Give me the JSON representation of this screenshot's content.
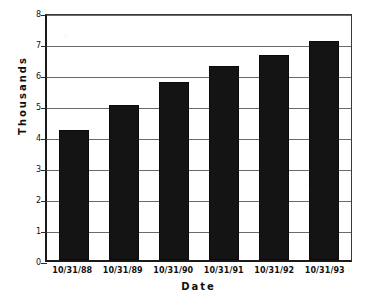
{
  "chart_data": {
    "type": "bar",
    "title": "",
    "xlabel": "Date",
    "ylabel": "Thousands",
    "categories": [
      "10/31/88",
      "10/31/89",
      "10/31/90",
      "10/31/91",
      "10/31/92",
      "10/31/93"
    ],
    "values": [
      4.2,
      5.0,
      5.75,
      6.25,
      6.6,
      7.05
    ],
    "ylim": [
      0,
      8
    ],
    "yticks": [
      8,
      7,
      6,
      5,
      4,
      3,
      2,
      1,
      0
    ],
    "ytick_labels": [
      "8",
      "7",
      "6",
      "5",
      "4",
      "3",
      "2",
      "1",
      "0"
    ],
    "grid": true,
    "legend": "none",
    "bar_color": "#141414",
    "gridline_color": "#6b6b6b",
    "axis_color": "#1a1a1a",
    "background": "#ffffff"
  },
  "axes": {
    "y_title": "Thousands",
    "x_title": "Date"
  },
  "ticks": {
    "y": [
      {
        "label": "8",
        "value": 8
      },
      {
        "label": "7",
        "value": 7
      },
      {
        "label": "6",
        "value": 6
      },
      {
        "label": "5",
        "value": 5
      },
      {
        "label": "4",
        "value": 4
      },
      {
        "label": "3",
        "value": 3
      },
      {
        "label": "2",
        "value": 2
      },
      {
        "label": "1",
        "value": 1
      },
      {
        "label": "0",
        "value": 0
      }
    ]
  },
  "bars": [
    {
      "label": "10/31/88",
      "value": 4.2
    },
    {
      "label": "10/31/89",
      "value": 5.0
    },
    {
      "label": "10/31/90",
      "value": 5.75
    },
    {
      "label": "10/31/91",
      "value": 6.25
    },
    {
      "label": "10/31/92",
      "value": 6.6
    },
    {
      "label": "10/31/93",
      "value": 7.05
    }
  ]
}
